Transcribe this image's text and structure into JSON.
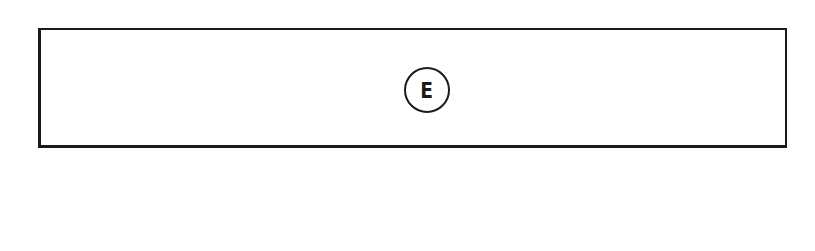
{
  "diagram": {
    "type": "block",
    "elements": [
      {
        "shape": "rectangle",
        "label": "E",
        "label_style": "circled-reference"
      }
    ]
  },
  "block": {
    "ref_label": "E"
  },
  "colors": {
    "stroke": "#1a1a1a",
    "background": "#ffffff"
  }
}
